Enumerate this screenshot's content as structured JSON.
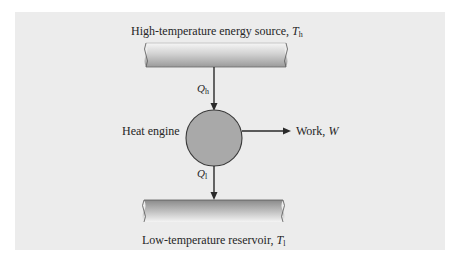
{
  "diagram": {
    "type": "heat-engine-schematic",
    "colors": {
      "panel_background": "#ececec",
      "engine_fill": "#a9a9a9",
      "stroke": "#2a2a2a",
      "reservoir_light": "#f4f4f4",
      "reservoir_dark": "#8e8e8e"
    },
    "hot_reservoir": {
      "label_text": "High-temperature energy source, ",
      "symbol": "T",
      "subscript": "h"
    },
    "heat_in": {
      "symbol": "Q",
      "subscript": "h"
    },
    "engine": {
      "label": "Heat engine"
    },
    "work_output": {
      "label_text": "Work, ",
      "symbol": "W"
    },
    "heat_out": {
      "symbol": "Q",
      "subscript": "l"
    },
    "cold_reservoir": {
      "label_text": "Low-temperature reservoir, ",
      "symbol": "T",
      "subscript": "l"
    }
  }
}
